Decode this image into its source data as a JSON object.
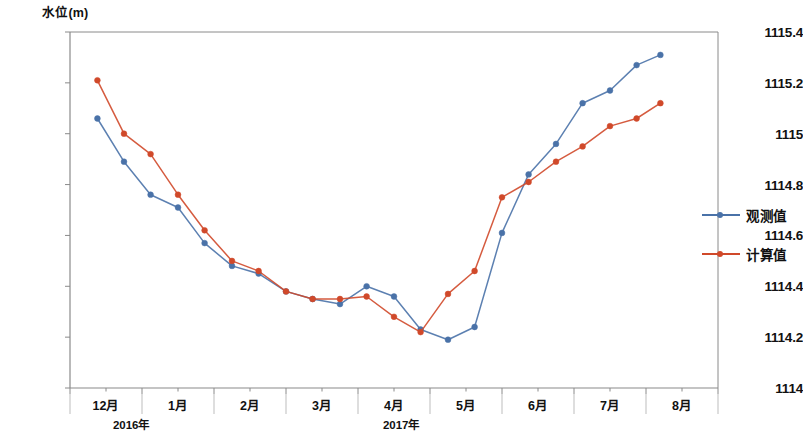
{
  "chart_data": {
    "type": "line",
    "title": "",
    "ylabel": "水位(m)",
    "xlabel": "",
    "ylim": [
      1114,
      1115.4
    ],
    "yticks": [
      "1114",
      "1114.2",
      "1114.4",
      "1114.6",
      "1114.8",
      "1115",
      "1115.2",
      "1115.4"
    ],
    "ytick_values": [
      1114,
      1114.2,
      1114.4,
      1114.6,
      1114.8,
      1115,
      1115.2,
      1115.4
    ],
    "categories": [
      "12月",
      "1月",
      "2月",
      "3月",
      "4月",
      "5月",
      "6月",
      "7月",
      "8月"
    ],
    "x_major_values": [
      0,
      1,
      2,
      3,
      4,
      5,
      6,
      7,
      8
    ],
    "year_labels": [
      {
        "text": "2016年",
        "x": 0.35
      },
      {
        "text": "2017年",
        "x": 4.1
      }
    ],
    "grid": false,
    "legend_position": "right",
    "series": [
      {
        "name": "观测值",
        "color": "#4a72a8",
        "x": [
          0.38,
          0.75,
          1.12,
          1.5,
          1.87,
          2.25,
          2.62,
          3.0,
          3.37,
          3.75,
          4.12,
          4.5,
          4.87,
          5.25,
          5.62,
          6.0,
          6.37,
          6.75,
          7.12,
          7.5
        ],
        "values": [
          1115.06,
          1114.89,
          1114.76,
          1114.71,
          1114.57,
          1114.48,
          1114.45,
          1114.38,
          1114.35,
          1114.33,
          1114.4,
          1114.36,
          1114.23,
          1114.19,
          1114.24,
          1114.61,
          1114.84,
          1114.96,
          1115.12,
          1115.17
        ]
      },
      {
        "name": "计算值",
        "color": "#d0492a",
        "x": [
          0.38,
          0.75,
          1.12,
          1.5,
          1.87,
          2.25,
          2.62,
          3.0,
          3.37,
          3.75,
          4.12,
          4.5,
          4.87,
          5.25,
          5.62,
          6.0,
          6.37,
          6.75,
          7.12,
          7.5
        ],
        "values": [
          1115.21,
          1115.0,
          1114.92,
          1114.76,
          1114.62,
          1114.5,
          1114.46,
          1114.38,
          1114.35,
          1114.35,
          1114.36,
          1114.28,
          1114.22,
          1114.37,
          1114.46,
          1114.75,
          1114.81,
          1114.89,
          1114.95,
          1115.03
        ]
      }
    ],
    "series_extra": [
      {
        "name": "观测值-tail",
        "color": "#4a72a8",
        "x": [
          7.87,
          8.2
        ],
        "values": [
          1115.27,
          1115.31
        ]
      },
      {
        "name": "计算值-tail",
        "color": "#d0492a",
        "x": [
          7.87,
          8.2
        ],
        "values": [
          1115.06,
          1115.12
        ]
      }
    ]
  },
  "legend": {
    "items": [
      {
        "label": "观测值",
        "color": "#4a72a8"
      },
      {
        "label": "计算值",
        "color": "#d0492a"
      }
    ]
  },
  "axes": {
    "y_title": "水位(m)",
    "axis_color": "#8a8a8a"
  }
}
